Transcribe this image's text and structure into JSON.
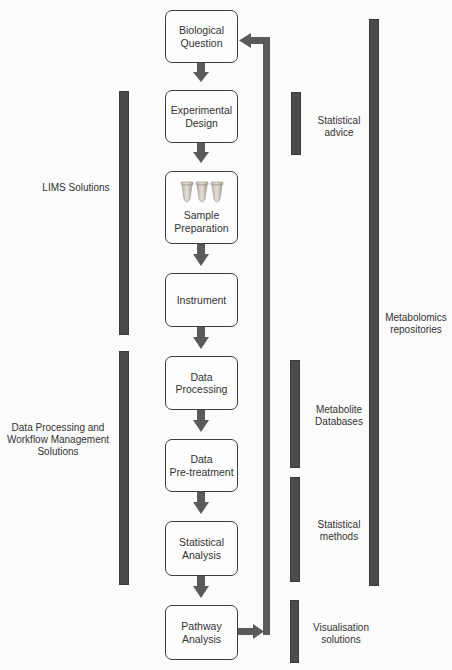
{
  "workflow": {
    "steps": [
      {
        "label": "Biological\nQuestion"
      },
      {
        "label": "Experimental\nDesign"
      },
      {
        "label": "Sample\nPreparation",
        "icon": "sample-tubes-icon"
      },
      {
        "label": "Instrument"
      },
      {
        "label": "Data\nProcessing"
      },
      {
        "label": "Data\nPre-treatment"
      },
      {
        "label": "Statistical\nAnalysis"
      },
      {
        "label": "Pathway\nAnalysis"
      }
    ],
    "feedback_arrow": "Pathway Analysis back to Biological Question"
  },
  "left_annotations": [
    {
      "label": "LIMS Solutions",
      "spans": "Experimental Design to Instrument"
    },
    {
      "label": "Data Processing and\nWorkflow Management\nSolutions",
      "spans": "Data Processing to Statistical Analysis"
    }
  ],
  "right_annotations": [
    {
      "label": "Statistical\nadvice"
    },
    {
      "label": "Metabolite\nDatabases"
    },
    {
      "label": "Statistical\nmethods"
    },
    {
      "label": "Visualisation\nsolutions"
    },
    {
      "label": "Metabolomics\nrepositories"
    }
  ],
  "colors": {
    "bar": "#4b4b4b",
    "arrow": "#5a5a5a",
    "box_border": "#3e3e3e",
    "background": "#fbfbfb"
  }
}
